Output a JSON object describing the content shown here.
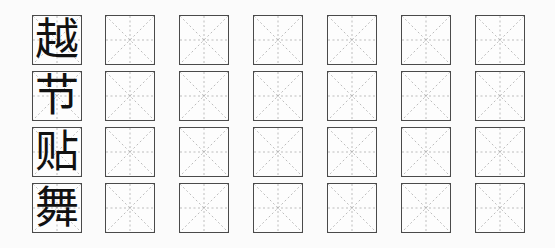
{
  "worksheet": {
    "rows": [
      {
        "character": "越"
      },
      {
        "character": "节"
      },
      {
        "character": "贴"
      },
      {
        "character": "舞"
      }
    ],
    "empty_cells_per_row": 6,
    "colors": {
      "border": "#4a4a4a",
      "guide_lines": "#9a9a9a",
      "character": "#111111",
      "background": "#fbfbfb"
    }
  }
}
